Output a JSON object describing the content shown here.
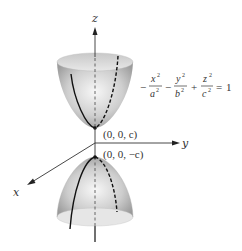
{
  "figure": {
    "type": "hyperboloid-of-two-sheets",
    "axes": {
      "x_label": "x",
      "y_label": "y",
      "z_label": "z"
    },
    "equation": {
      "term1": {
        "sign": "−",
        "numerator": "x",
        "num_exp": "2",
        "denominator": "a",
        "den_exp": "2"
      },
      "term2": {
        "sign": "−",
        "numerator": "y",
        "num_exp": "2",
        "denominator": "b",
        "den_exp": "2"
      },
      "term3": {
        "sign": "+",
        "numerator": "z",
        "num_exp": "2",
        "denominator": "c",
        "den_exp": "2"
      },
      "equals": "=",
      "rhs": "1"
    },
    "points": {
      "upper_vertex": "(0, 0, c)",
      "lower_vertex": "(0, 0, −c)"
    },
    "colors": {
      "surface_light": "#f4f4f4",
      "surface_dark": "#9a9a9a",
      "curve": "#111111",
      "axis": "#333333"
    }
  }
}
